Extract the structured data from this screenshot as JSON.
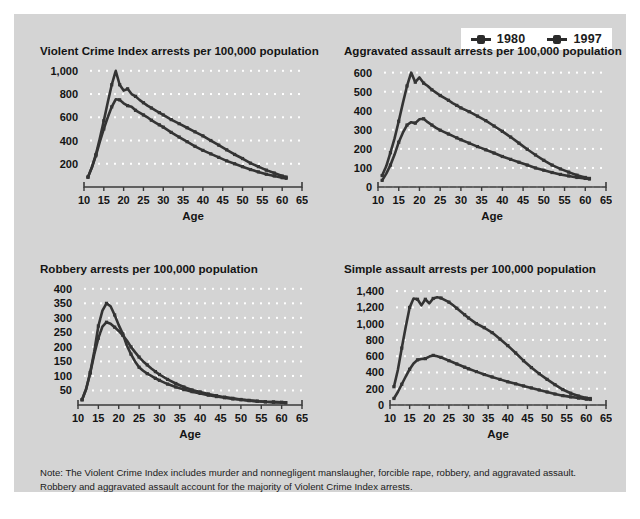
{
  "legend": {
    "entries": [
      {
        "label": "1980",
        "color": "#343434",
        "marker": "line-marker-icon"
      },
      {
        "label": "1997",
        "color": "#343434",
        "marker": "line-marker-icon"
      }
    ]
  },
  "note": {
    "line1": "Note: The Violent Crime Index includes murder and nonnegligent manslaugher, forcible rape, robbery, and aggravated assault.",
    "line2": "Robbery and aggravated assault account for the majority of Violent Crime Index arrests."
  },
  "colors": {
    "panel_background": "#d4d4d4",
    "gridline": "#ffffff",
    "axis": "#3a3a3a",
    "series": "#343434",
    "text": "#141414",
    "legend_background": "#ffffff"
  },
  "chart_data": [
    {
      "type": "line",
      "title": "Violent Crime Index arrests per 100,000 population",
      "xlabel": "Age",
      "ylabel": "",
      "xlim": [
        10,
        65
      ],
      "ylim": [
        0,
        1050
      ],
      "xticks": [
        10,
        15,
        20,
        25,
        30,
        35,
        40,
        45,
        50,
        55,
        60,
        65
      ],
      "yticks": [
        200,
        400,
        600,
        800,
        1000
      ],
      "ytick_labels": [
        "200",
        "400",
        "600",
        "800",
        "1,000"
      ],
      "grid": true,
      "legend_position": "figure-top-right",
      "x": [
        11,
        12,
        13,
        14,
        15,
        16,
        17,
        18,
        19,
        20,
        21,
        22,
        23,
        24,
        25,
        26,
        27,
        28,
        29,
        30,
        32,
        34,
        36,
        38,
        40,
        42,
        44,
        46,
        48,
        50,
        52,
        54,
        56,
        58,
        60,
        61
      ],
      "series": [
        {
          "name": "1980",
          "values": [
            85,
            170,
            270,
            390,
            500,
            600,
            690,
            755,
            750,
            720,
            700,
            690,
            660,
            640,
            620,
            600,
            575,
            555,
            535,
            515,
            470,
            430,
            390,
            350,
            315,
            285,
            255,
            225,
            200,
            175,
            150,
            130,
            110,
            95,
            80,
            75
          ]
        },
        {
          "name": "1997",
          "values": [
            85,
            170,
            280,
            420,
            570,
            730,
            880,
            1000,
            880,
            830,
            845,
            800,
            780,
            750,
            725,
            700,
            680,
            660,
            640,
            620,
            580,
            545,
            510,
            475,
            440,
            400,
            360,
            320,
            280,
            245,
            205,
            175,
            145,
            120,
            95,
            85
          ]
        }
      ]
    },
    {
      "type": "line",
      "title": "Aggravated assault arrests per 100,000 population",
      "xlabel": "Age",
      "ylabel": "",
      "xlim": [
        10,
        65
      ],
      "ylim": [
        0,
        640
      ],
      "xticks": [
        10,
        15,
        20,
        25,
        30,
        35,
        40,
        45,
        50,
        55,
        60,
        65
      ],
      "yticks": [
        0,
        100,
        200,
        300,
        400,
        500,
        600
      ],
      "ytick_labels": [
        "0",
        "100",
        "200",
        "300",
        "400",
        "500",
        "600"
      ],
      "grid": true,
      "x": [
        11,
        12,
        13,
        14,
        15,
        16,
        17,
        18,
        19,
        20,
        21,
        22,
        23,
        24,
        25,
        26,
        27,
        28,
        29,
        30,
        32,
        34,
        36,
        38,
        40,
        42,
        44,
        46,
        48,
        50,
        52,
        54,
        56,
        58,
        60,
        61
      ],
      "series": [
        {
          "name": "1980",
          "values": [
            35,
            70,
            115,
            170,
            235,
            285,
            325,
            340,
            335,
            355,
            358,
            340,
            325,
            310,
            298,
            288,
            278,
            268,
            258,
            248,
            230,
            212,
            195,
            178,
            160,
            145,
            130,
            115,
            100,
            88,
            76,
            66,
            58,
            50,
            45,
            42
          ]
        },
        {
          "name": "1997",
          "values": [
            60,
            110,
            180,
            255,
            345,
            440,
            530,
            600,
            550,
            575,
            545,
            530,
            510,
            495,
            480,
            468,
            455,
            440,
            428,
            415,
            395,
            372,
            348,
            320,
            292,
            262,
            230,
            198,
            168,
            140,
            115,
            95,
            78,
            62,
            50,
            45
          ]
        }
      ]
    },
    {
      "type": "line",
      "title": "Robbery arrests per 100,000 population",
      "xlabel": "Age",
      "ylabel": "",
      "xlim": [
        10,
        65
      ],
      "ylim": [
        0,
        420
      ],
      "xticks": [
        10,
        15,
        20,
        25,
        30,
        35,
        40,
        45,
        50,
        55,
        60,
        65
      ],
      "yticks": [
        50,
        100,
        150,
        200,
        250,
        300,
        350,
        400
      ],
      "ytick_labels": [
        "50",
        "100",
        "150",
        "200",
        "250",
        "300",
        "350",
        "400"
      ],
      "grid": true,
      "x": [
        11,
        12,
        13,
        14,
        15,
        16,
        17,
        18,
        19,
        20,
        21,
        22,
        23,
        24,
        25,
        26,
        27,
        28,
        29,
        30,
        32,
        34,
        36,
        38,
        40,
        42,
        44,
        46,
        48,
        50,
        52,
        54,
        56,
        58,
        60,
        61
      ],
      "series": [
        {
          "name": "1980",
          "values": [
            18,
            55,
            110,
            175,
            230,
            270,
            285,
            280,
            268,
            255,
            240,
            222,
            200,
            182,
            165,
            150,
            138,
            126,
            115,
            105,
            88,
            74,
            62,
            52,
            45,
            38,
            32,
            27,
            23,
            19,
            16,
            13,
            11,
            10,
            9,
            8
          ]
        },
        {
          "name": "1997",
          "values": [
            18,
            55,
            112,
            185,
            272,
            325,
            350,
            340,
            310,
            275,
            245,
            205,
            175,
            150,
            130,
            118,
            108,
            100,
            92,
            85,
            72,
            62,
            53,
            46,
            40,
            34,
            29,
            25,
            21,
            18,
            15,
            13,
            11,
            10,
            9,
            8
          ]
        }
      ]
    },
    {
      "type": "line",
      "title": "Simple assault arrests per 100,000 population",
      "xlabel": "Age",
      "ylabel": "",
      "xlim": [
        10,
        65
      ],
      "ylim": [
        0,
        1500
      ],
      "xticks": [
        10,
        15,
        20,
        25,
        30,
        35,
        40,
        45,
        50,
        55,
        60,
        65
      ],
      "yticks": [
        0,
        200,
        400,
        600,
        800,
        1000,
        1200,
        1400
      ],
      "ytick_labels": [
        "0",
        "200",
        "400",
        "600",
        "800",
        "1,000",
        "1,200",
        "1,400"
      ],
      "grid": true,
      "x": [
        11,
        12,
        13,
        14,
        15,
        16,
        17,
        18,
        19,
        20,
        21,
        22,
        23,
        24,
        25,
        26,
        27,
        28,
        29,
        30,
        32,
        34,
        36,
        38,
        40,
        42,
        44,
        46,
        48,
        50,
        52,
        54,
        56,
        58,
        60,
        61
      ],
      "series": [
        {
          "name": "1980",
          "values": [
            80,
            160,
            255,
            350,
            440,
            510,
            555,
            565,
            570,
            595,
            610,
            600,
            585,
            565,
            545,
            525,
            505,
            485,
            465,
            445,
            410,
            375,
            345,
            315,
            285,
            260,
            235,
            210,
            185,
            160,
            135,
            115,
            100,
            85,
            72,
            68
          ]
        },
        {
          "name": "1997",
          "values": [
            225,
            430,
            700,
            960,
            1200,
            1310,
            1300,
            1225,
            1300,
            1250,
            1310,
            1325,
            1315,
            1290,
            1265,
            1230,
            1190,
            1150,
            1110,
            1070,
            1000,
            950,
            890,
            810,
            730,
            640,
            545,
            460,
            385,
            315,
            250,
            190,
            145,
            110,
            85,
            80
          ]
        }
      ]
    }
  ]
}
